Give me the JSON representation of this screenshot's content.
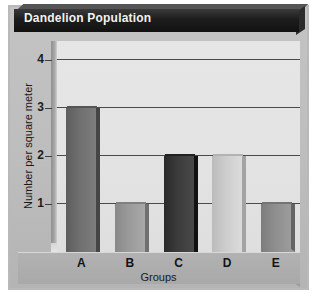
{
  "chart_data": {
    "type": "bar",
    "title": "Dandelion Population",
    "xlabel": "Groups",
    "ylabel": "Number per square meter",
    "categories": [
      "A",
      "B",
      "C",
      "D",
      "E"
    ],
    "values": [
      3,
      1,
      2,
      2,
      1
    ],
    "ylim": [
      0,
      4.4
    ],
    "yticks": [
      1,
      2,
      3,
      4
    ],
    "ytick_labels": [
      "1",
      "2",
      "3",
      "4"
    ],
    "grid": true,
    "legend": "none",
    "bar_colors": [
      "#6f6f6f",
      "#9a9a9a",
      "#3b3b3b",
      "#cdcdcd",
      "#8e8e8e"
    ],
    "series": [
      {
        "name": "Dandelion count",
        "values": [
          3,
          1,
          2,
          2,
          1
        ]
      }
    ],
    "bars": [
      {
        "category": "A",
        "value": 3,
        "color": "#6f6f6f"
      },
      {
        "category": "B",
        "value": 1,
        "color": "#9a9a9a"
      },
      {
        "category": "C",
        "value": 2,
        "color": "#3b3b3b"
      },
      {
        "category": "D",
        "value": 2,
        "color": "#cdcdcd"
      },
      {
        "category": "E",
        "value": 1,
        "color": "#8e8e8e"
      }
    ]
  },
  "colors": {
    "panel": "#bdbdbd",
    "plot_background": "#e3e3e3",
    "banner": "#1d1d1d",
    "banner_text": "#f2f2f2",
    "gridline": "#4a4a4a",
    "axis_text": "#191919"
  }
}
